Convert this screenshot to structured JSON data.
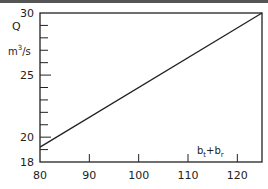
{
  "chart_data": {
    "type": "line",
    "title": "",
    "xlabel": "b_t + b_r",
    "xlabel_parts": {
      "base1": "b",
      "sub1": "t",
      "op": "+",
      "base2": "b",
      "sub2": "r"
    },
    "ylabel": "Q",
    "yunit": "m³/s",
    "yunit_parts": {
      "pre": "m",
      "sup": "3",
      "post": "/s"
    },
    "xlim": [
      80,
      125
    ],
    "ylim": [
      18,
      30
    ],
    "xticks": [
      80,
      90,
      100,
      110,
      120
    ],
    "xtick_labels": [
      "80",
      "90",
      "100",
      "110",
      "120"
    ],
    "yticks_major": [
      18,
      20,
      25,
      30
    ],
    "ytick_labels": [
      "18",
      "20",
      "25",
      "30"
    ],
    "yticks_minor": [
      19,
      21,
      22,
      23,
      24,
      26,
      27,
      28,
      29
    ],
    "grid": false,
    "legend": "none",
    "series": [
      {
        "name": "Q",
        "x": [
          80,
          125
        ],
        "y": [
          19.2,
          30
        ]
      }
    ]
  }
}
